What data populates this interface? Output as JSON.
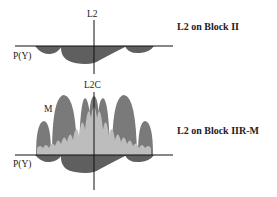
{
  "diagrams": [
    {
      "title": "L2 on Block II",
      "vertical_axis_label": "L2",
      "baseline_label": "P(Y)",
      "signals": [
        "P(Y)"
      ]
    },
    {
      "title": "L2 on Block IIR-M",
      "vertical_axis_label": "L2C",
      "baseline_label": "P(Y)",
      "lobe_label": "M",
      "signals": [
        "P(Y)",
        "M",
        "L2C"
      ]
    }
  ],
  "colors": {
    "py_fill": "#5f5f5f",
    "m_fill": "#7a7a7a",
    "l2c_fill": "#bdbdbd",
    "axis": "#111111"
  }
}
